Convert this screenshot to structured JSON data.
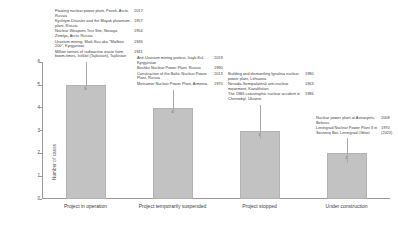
{
  "chart_data": {
    "type": "bar",
    "title": "",
    "xlabel": "",
    "ylabel": "Number of cases",
    "ylim": [
      0,
      6
    ],
    "yticks": [
      0,
      1,
      2,
      3,
      4,
      5,
      6
    ],
    "grid": false,
    "legend": "none",
    "categories": [
      "Project in operation",
      "Project temporarily suspended",
      "Project stopped",
      "Under construction"
    ],
    "values": [
      5,
      4,
      3,
      2
    ]
  },
  "axis": {
    "y_title": "Number of cases",
    "y_ticks": [
      "6",
      "5",
      "4",
      "3",
      "2",
      "1",
      "0"
    ]
  },
  "bars": [
    {
      "label": "Project in operation",
      "value": "5"
    },
    {
      "label": "Project temporarily suspended",
      "value": "4"
    },
    {
      "label": "Project stopped",
      "value": "3"
    },
    {
      "label": "Under construction",
      "value": "2"
    }
  ],
  "callouts": [
    {
      "id": "callout-project-in-operation",
      "entries": [
        {
          "text": "Floating nuclear power plant, Pevek, Arctic Russia",
          "year": "2017"
        },
        {
          "text": "Kyshtym Disaster and the Mayak plutonium plant, Russia",
          "year": "1957"
        },
        {
          "text": "Nuclear Weapons Test Site, Novaya Zemlya, Arctic Russia",
          "year": "1954"
        },
        {
          "text": "Uranium mining, Maili-Suu aka \"Mailbox 200\", Kyrgyzstan",
          "year": "1946"
        },
        {
          "text": "Million tonnes of radioactive waste from boom-times, Istiklol (Tajikistan), Tajikistan",
          "year": "1941"
        }
      ]
    },
    {
      "id": "callout-project-temporarily-suspended",
      "entries": [
        {
          "text": "Anti-Uranium mining protest, Issyk-Kul, Kyrgyzstan",
          "year": "2019"
        },
        {
          "text": "Bashkir Nuclear Power Plant, Russia",
          "year": "1990"
        },
        {
          "text": "Construction of the Baltic Nuclear Power Plant, Russia",
          "year": "2013"
        },
        {
          "text": "Metsamor Nuclear Power Plant, Armenia",
          "year": "1970"
        }
      ]
    },
    {
      "id": "callout-project-stopped",
      "entries": [
        {
          "text": "Building and dismantling Ignalina nuclear power plant, Lithuania",
          "year": "1980"
        },
        {
          "text": "Nevada-Semipalatinsk anti-nuclear movement, Kazakhstan",
          "year": "1963"
        },
        {
          "text": "The 1986 catastrophic nuclear accident in Chernobyl, Ukraine",
          "year": "1986"
        }
      ]
    },
    {
      "id": "callout-under-construction",
      "entries": [
        {
          "text": "Nuclear power plant at Astravyets, Belarus",
          "year": "2008"
        },
        {
          "text": "Leningrad Nuclear Power Plant II in Sosnovy Bor, Leningrad Oblast",
          "year": "1970\n(2020)"
        }
      ]
    }
  ]
}
